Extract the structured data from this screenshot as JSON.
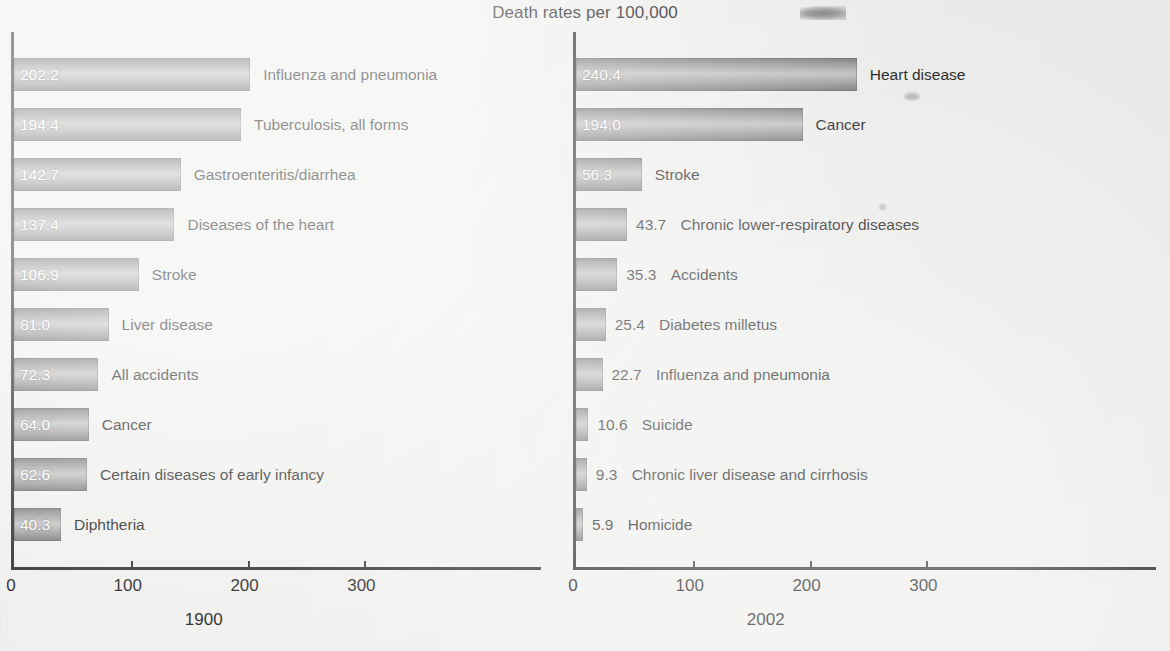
{
  "title": "Death rates per 100,000",
  "chart_data": [
    {
      "type": "bar",
      "title": "1900",
      "orientation": "horizontal",
      "xlabel": "Death rates per 100,000",
      "ylabel": "",
      "xlim": [
        0,
        370
      ],
      "xticks": [
        0,
        100,
        200,
        300
      ],
      "xtick_labels": [
        "0",
        "100",
        "200",
        "300"
      ],
      "grid": false,
      "legend": "none",
      "categories": [
        "Influenza and pneumonia",
        "Tuberculosis, all forms",
        "Gastroenteritis/diarrhea",
        "Diseases of the heart",
        "Stroke",
        "Liver disease",
        "All accidents",
        "Cancer",
        "Certain diseases of early infancy",
        "Diphtheria"
      ],
      "values": [
        202.2,
        194.4,
        142.7,
        137.4,
        106.9,
        81.0,
        72.3,
        64.0,
        62.6,
        40.3
      ],
      "value_labels": [
        "202.2",
        "194.4",
        "142.7",
        "137.4",
        "106.9",
        "81.0",
        "72.3",
        "64.0",
        "62.6",
        "40.3"
      ],
      "label_placement": [
        "inside",
        "inside",
        "inside",
        "inside",
        "inside",
        "inside",
        "inside",
        "inside",
        "inside",
        "inside"
      ]
    },
    {
      "type": "bar",
      "title": "2002",
      "orientation": "horizontal",
      "xlabel": "Death rates per 100,000",
      "ylabel": "",
      "xlim": [
        0,
        370
      ],
      "xticks": [
        0,
        100,
        200,
        300
      ],
      "xtick_labels": [
        "0",
        "100",
        "200",
        "300"
      ],
      "grid": false,
      "legend": "none",
      "categories": [
        "Heart disease",
        "Cancer",
        "Stroke",
        "Chronic lower-respiratory diseases",
        "Accidents",
        "Diabetes milletus",
        "Influenza and pneumonia",
        "Suicide",
        "Chronic liver disease and cirrhosis",
        "Homicide"
      ],
      "values": [
        240.4,
        194.0,
        56.3,
        43.7,
        35.3,
        25.4,
        22.7,
        10.6,
        9.3,
        5.9
      ],
      "value_labels": [
        "240.4",
        "194.0",
        "56.3",
        "43.7",
        "35.3",
        "25.4",
        "22.7",
        "10.6",
        "9.3",
        "5.9"
      ],
      "label_placement": [
        "inside",
        "inside",
        "inside",
        "outside",
        "outside",
        "outside",
        "outside",
        "outside",
        "outside",
        "outside"
      ]
    }
  ],
  "colors": {
    "background": "#eeeeec",
    "bar_dark": "#6b6b6b",
    "bar_light": "#bdbdbd",
    "axis": "#1b1b1b",
    "text": "#0a0a0a",
    "value_inside": "#ffffff"
  }
}
